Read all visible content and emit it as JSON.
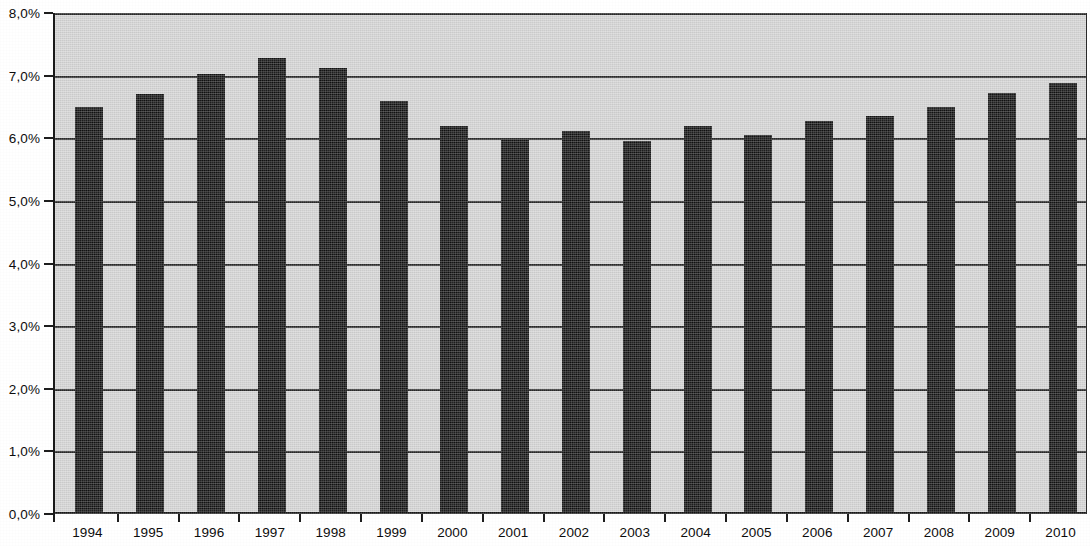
{
  "chart_data": {
    "type": "bar",
    "title": "",
    "subtitle": "",
    "xlabel": "",
    "ylabel": "",
    "categories": [
      "1994",
      "1995",
      "1996",
      "1997",
      "1998",
      "1999",
      "2000",
      "2001",
      "2002",
      "2003",
      "2004",
      "2005",
      "2006",
      "2007",
      "2008",
      "2009",
      "2010"
    ],
    "values": [
      6.5,
      6.7,
      7.03,
      7.28,
      7.12,
      6.6,
      6.2,
      5.97,
      6.12,
      5.96,
      6.2,
      6.05,
      6.27,
      6.35,
      6.5,
      6.72,
      6.88
    ],
    "value_format": "percent",
    "decimal_separator": ",",
    "ylim": [
      0,
      8
    ],
    "y_ticks": [
      0,
      1,
      2,
      3,
      4,
      5,
      6,
      7,
      8
    ],
    "y_tick_labels": [
      "0,0%",
      "1,0%",
      "2,0%",
      "3,0%",
      "4,0%",
      "5,0%",
      "6,0%",
      "7,0%",
      "8,0%"
    ],
    "grid": true,
    "grid_axis": "y",
    "legend": false,
    "legend_position": "none",
    "series": [
      {
        "name": "",
        "values": [
          6.5,
          6.7,
          7.03,
          7.28,
          7.12,
          6.6,
          6.2,
          5.97,
          6.12,
          5.96,
          6.2,
          6.05,
          6.27,
          6.35,
          6.5,
          6.72,
          6.88
        ]
      }
    ],
    "colors": {
      "bar": "#121212",
      "plot_background": "#d7d7d7",
      "gridline": "#2b2b2b",
      "axis": "#1a1a1a",
      "text": "#0d0d0d",
      "page_background": "#ffffff"
    }
  }
}
